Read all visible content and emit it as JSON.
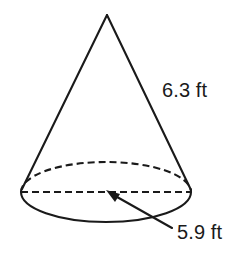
{
  "figure": {
    "shape_name": "cone",
    "background_color": "#ffffff",
    "stroke_color": "#1a1a1a",
    "labels": {
      "slant_height": "6.3 ft",
      "base_diameter": "5.9 ft"
    },
    "geometry": {
      "apex": {
        "x": 107,
        "y": 15
      },
      "base_center": {
        "x": 106,
        "y": 192
      },
      "base_radius_x": 85,
      "base_radius_y": 30,
      "left_tangent": {
        "x": 22,
        "y": 189
      },
      "right_tangent": {
        "x": 191,
        "y": 190
      },
      "diameter_line_y": 192,
      "diameter_line_x1": 21,
      "diameter_line_x2": 191,
      "arrow_tail": {
        "x": 172,
        "y": 228
      },
      "arrow_tip": {
        "x": 107,
        "y": 191
      },
      "stroke_width": 2,
      "dash_pattern": "7 4"
    }
  }
}
